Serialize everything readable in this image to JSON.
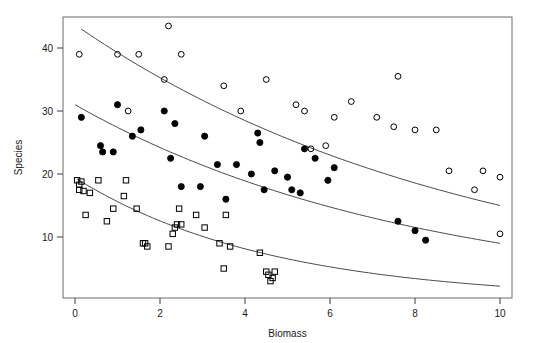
{
  "chart_data": {
    "type": "scatter",
    "title": "",
    "xlabel": "Biomass",
    "ylabel": "Species",
    "xlim": [
      -0.35,
      10.4
    ],
    "ylim": [
      1.0,
      45.5
    ],
    "xticks": [
      0,
      2,
      4,
      6,
      8,
      10
    ],
    "yticks": [
      10,
      20,
      30,
      40
    ],
    "grid": false,
    "legend": "none",
    "frame": "box",
    "series": [
      {
        "name": "open-circle-series",
        "marker": "open-circle",
        "color": "#000000",
        "points": [
          [
            0.1,
            39.0
          ],
          [
            1.0,
            39.0
          ],
          [
            1.25,
            30.0
          ],
          [
            1.5,
            39.0
          ],
          [
            2.1,
            35.0
          ],
          [
            2.2,
            43.5
          ],
          [
            2.5,
            39.0
          ],
          [
            3.5,
            34.0
          ],
          [
            3.9,
            30.0
          ],
          [
            4.5,
            35.0
          ],
          [
            5.2,
            31.0
          ],
          [
            5.4,
            30.0
          ],
          [
            5.55,
            24.0
          ],
          [
            5.9,
            24.5
          ],
          [
            6.1,
            29.0
          ],
          [
            6.5,
            31.5
          ],
          [
            7.1,
            29.0
          ],
          [
            7.5,
            27.5
          ],
          [
            7.6,
            35.5
          ],
          [
            8.0,
            27.0
          ],
          [
            8.5,
            27.0
          ],
          [
            8.8,
            20.5
          ],
          [
            9.4,
            17.5
          ],
          [
            9.6,
            20.5
          ],
          [
            10.0,
            19.5
          ],
          [
            10.0,
            10.5
          ]
        ]
      },
      {
        "name": "filled-circle-series",
        "marker": "filled-circle",
        "color": "#000000",
        "points": [
          [
            0.15,
            29.0
          ],
          [
            0.6,
            24.5
          ],
          [
            0.65,
            23.5
          ],
          [
            0.9,
            23.5
          ],
          [
            1.0,
            31.0
          ],
          [
            1.35,
            26.0
          ],
          [
            1.55,
            27.0
          ],
          [
            2.1,
            30.0
          ],
          [
            2.25,
            22.5
          ],
          [
            2.35,
            28.0
          ],
          [
            2.5,
            18.0
          ],
          [
            2.95,
            18.0
          ],
          [
            3.05,
            26.0
          ],
          [
            3.35,
            21.5
          ],
          [
            3.55,
            16.0
          ],
          [
            3.8,
            21.5
          ],
          [
            4.15,
            20.0
          ],
          [
            4.3,
            26.5
          ],
          [
            4.35,
            25.0
          ],
          [
            4.45,
            17.5
          ],
          [
            4.7,
            20.5
          ],
          [
            5.0,
            19.5
          ],
          [
            5.1,
            17.5
          ],
          [
            5.3,
            17.0
          ],
          [
            5.4,
            24.0
          ],
          [
            5.65,
            22.5
          ],
          [
            5.95,
            19.0
          ],
          [
            6.1,
            21.0
          ],
          [
            7.6,
            12.5
          ],
          [
            8.0,
            11.0
          ],
          [
            8.25,
            9.5
          ]
        ]
      },
      {
        "name": "open-square-series",
        "marker": "open-square",
        "color": "#000000",
        "points": [
          [
            0.05,
            19.0
          ],
          [
            0.1,
            18.3
          ],
          [
            0.1,
            17.5
          ],
          [
            0.15,
            18.8
          ],
          [
            0.2,
            17.3
          ],
          [
            0.25,
            13.5
          ],
          [
            0.35,
            17.0
          ],
          [
            0.55,
            19.0
          ],
          [
            0.75,
            12.5
          ],
          [
            0.9,
            14.5
          ],
          [
            1.15,
            16.5
          ],
          [
            1.2,
            19.0
          ],
          [
            1.45,
            14.5
          ],
          [
            1.6,
            9.0
          ],
          [
            1.65,
            9.0
          ],
          [
            1.7,
            8.5
          ],
          [
            2.2,
            8.5
          ],
          [
            2.3,
            10.5
          ],
          [
            2.35,
            11.5
          ],
          [
            2.4,
            12.0
          ],
          [
            2.45,
            14.5
          ],
          [
            2.5,
            12.0
          ],
          [
            2.85,
            13.5
          ],
          [
            3.05,
            11.5
          ],
          [
            3.4,
            9.0
          ],
          [
            3.5,
            5.0
          ],
          [
            3.55,
            13.5
          ],
          [
            3.65,
            8.5
          ],
          [
            4.35,
            7.5
          ],
          [
            4.5,
            4.5
          ],
          [
            4.55,
            4.0
          ],
          [
            4.6,
            3.0
          ],
          [
            4.65,
            3.5
          ],
          [
            4.7,
            4.5
          ]
        ]
      }
    ],
    "fitted_curves": [
      {
        "name": "upper-curve",
        "for_series": "open-circle-series",
        "x_start": 0.15,
        "x_end": 10.0,
        "y_start": 43.0,
        "y_end": 15.0
      },
      {
        "name": "middle-curve",
        "for_series": "filled-circle-series",
        "x_start": 0.0,
        "x_end": 10.0,
        "y_start": 31.0,
        "y_end": 9.0
      },
      {
        "name": "lower-curve",
        "for_series": "open-square-series",
        "x_start": 0.05,
        "x_end": 10.0,
        "y_start": 19.2,
        "y_end": 2.2
      }
    ]
  }
}
